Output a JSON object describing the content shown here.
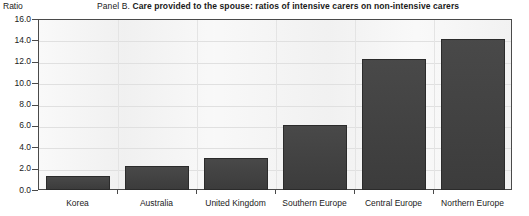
{
  "axis_unit_label": "Ratio",
  "title": {
    "panel_tag": "Panel B.",
    "panel_text": "Care provided to the spouse: ratios of intensive carers on non-intensive carers"
  },
  "colors": {
    "bar_fill": "#3f3f3f",
    "bar_border": "#2b2b2b",
    "plot_background": "#f2f2f2",
    "frame": "#4a4a4a",
    "gridline": "#e0e0e0",
    "text": "#1a1a1a"
  },
  "chart_data": {
    "type": "bar",
    "title": "Panel B. Care provided to the spouse: ratios of intensive carers on non-intensive carers",
    "xlabel": "",
    "ylabel": "Ratio",
    "ylim": [
      0.0,
      16.0
    ],
    "ytick_step": 2.0,
    "ytick_labels": [
      "16.0",
      "14.0",
      "12.0",
      "10.0",
      "8.0",
      "6.0",
      "4.0",
      "2.0",
      "0.0"
    ],
    "ytick_values": [
      16.0,
      14.0,
      12.0,
      10.0,
      8.0,
      6.0,
      4.0,
      2.0,
      0.0
    ],
    "grid": true,
    "legend": false,
    "categories": [
      "Korea",
      "Australia",
      "United Kingdom",
      "Southern Europe",
      "Central Europe",
      "Northern Europe"
    ],
    "values": [
      1.3,
      2.2,
      3.0,
      6.1,
      12.3,
      14.1
    ]
  }
}
